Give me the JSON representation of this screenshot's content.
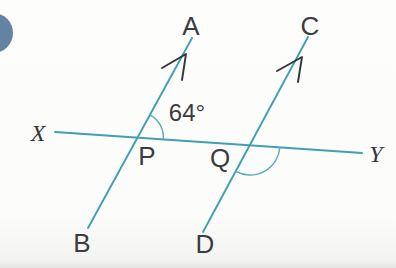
{
  "figure": {
    "labels": {
      "ray_a": "A",
      "ray_c": "C",
      "end_x": "X",
      "end_y": "Y",
      "point_p": "P",
      "point_q": "Q",
      "ray_b": "B",
      "ray_d": "D",
      "angle_p": "64°"
    },
    "colors": {
      "line_teal": "#3fa0b4",
      "arc_teal": "#5caabb",
      "arrow_black": "#343539",
      "text_dark": "#3b3c41",
      "bullet_blue": "#5b7c9d",
      "background": "#fcfcfa"
    }
  }
}
